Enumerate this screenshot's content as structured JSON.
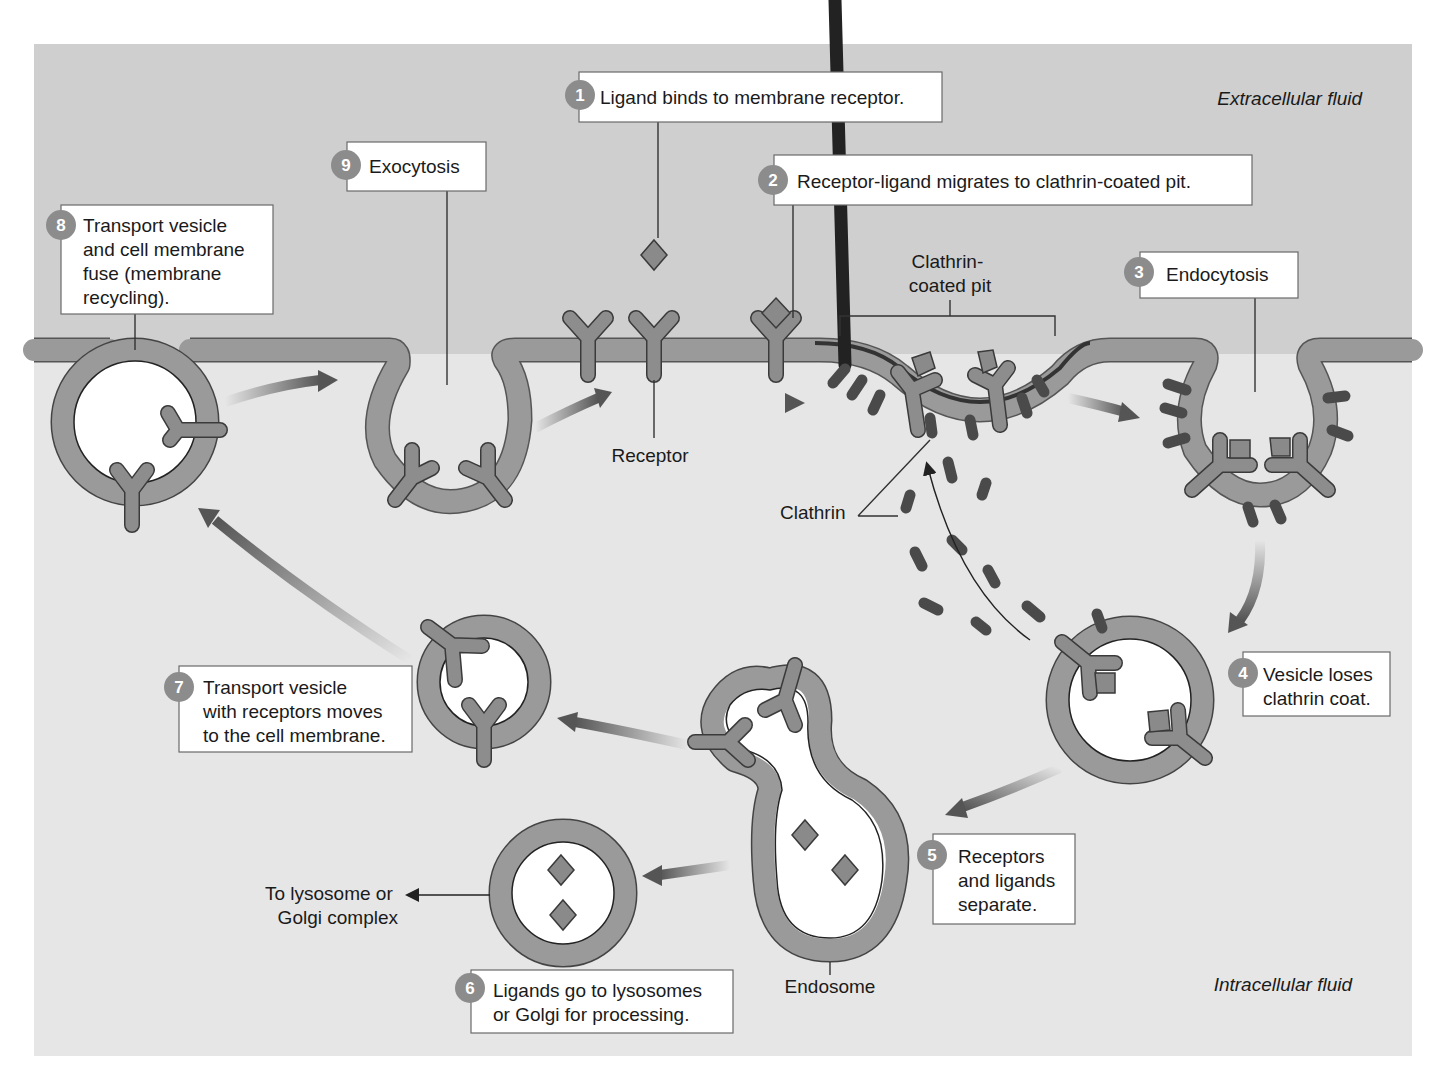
{
  "figure": {
    "region_labels": {
      "extracellular": "Extracellular fluid",
      "intracellular": "Intracellular fluid"
    },
    "steps": [
      {
        "number": "1",
        "text": [
          "Ligand binds to membrane receptor."
        ]
      },
      {
        "number": "2",
        "text": [
          "Receptor-ligand migrates to clathrin-coated pit."
        ]
      },
      {
        "number": "3",
        "text": [
          "Endocytosis"
        ]
      },
      {
        "number": "4",
        "text": [
          "Vesicle loses",
          "clathrin coat."
        ]
      },
      {
        "number": "5",
        "text": [
          "Receptors",
          "and ligands",
          "separate."
        ]
      },
      {
        "number": "6",
        "text": [
          "Ligands go to lysosomes",
          "or Golgi for processing."
        ]
      },
      {
        "number": "7",
        "text": [
          "Transport vesicle",
          "with receptors moves",
          "to the cell membrane."
        ]
      },
      {
        "number": "8",
        "text": [
          "Transport vesicle",
          "and cell membrane",
          "fuse (membrane",
          "recycling)."
        ]
      },
      {
        "number": "9",
        "text": [
          "Exocytosis"
        ]
      }
    ],
    "structure_labels": {
      "clathrin_pit": [
        "Clathrin-",
        "coated pit"
      ],
      "receptor": "Receptor",
      "clathrin": "Clathrin",
      "endosome": "Endosome",
      "lysosome_dest": [
        "To lysosome or",
        "Golgi complex"
      ]
    },
    "colors": {
      "extracellular_bg": "#cfcfcf",
      "intracellular_bg": "#e6e6e6",
      "membrane": "#9a9a9a",
      "receptor": "#8d8d8d",
      "clathrin": "#4a4a4a",
      "step_badge": "#8c8c8c"
    }
  }
}
